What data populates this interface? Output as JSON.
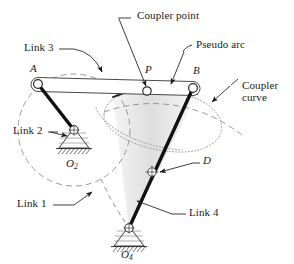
{
  "figure": {
    "width": 294,
    "height": 264,
    "background": "#ffffff"
  },
  "colors": {
    "stroke_dark": "#1a1a1a",
    "stroke_thin": "#555555",
    "dash_gray": "#888888",
    "dot_gray": "#999999",
    "wedge_fill": "#d9d9d9",
    "wedge_fill_light": "#ebebeb",
    "joint_fill": "#ffffff",
    "text": "#1a1a1a"
  },
  "labels": {
    "coupler_point": "Coupler point",
    "pseudo_arc": "Pseudo arc",
    "coupler_curve_line1": "Coupler",
    "coupler_curve_line2": "curve",
    "link3": "Link 3",
    "link2": "Link 2",
    "link1": "Link 1",
    "link4": "Link 4",
    "point_a": "A",
    "point_b": "B",
    "point_p": "P",
    "point_d": "D",
    "pivot_o2_base": "O",
    "pivot_o2_sub": "2",
    "pivot_o4_base": "O",
    "pivot_o4_sub": "4"
  },
  "geometry": {
    "point_a": [
      38,
      84
    ],
    "point_p": [
      147,
      93
    ],
    "point_b": [
      193,
      88
    ],
    "point_o2": [
      74,
      130
    ],
    "point_o4": [
      129,
      228
    ],
    "point_d": [
      152,
      172
    ],
    "crank_circle_center": [
      74,
      130
    ],
    "crank_circle_radius": 56,
    "coupler_bar_from": [
      38,
      84
    ],
    "coupler_bar_to": [
      193,
      88
    ]
  },
  "leaders": {
    "coupler_point_from": [
      118,
      18
    ],
    "coupler_point_to": [
      147,
      90
    ],
    "pseudo_arc_from": [
      184,
      47
    ],
    "pseudo_arc_to": [
      170,
      91
    ],
    "coupler_curve_from": [
      228,
      87
    ],
    "coupler_curve_to": [
      207,
      105
    ],
    "link3_from": [
      70,
      47
    ],
    "link3_to": [
      105,
      80
    ],
    "link2_from": [
      48,
      130
    ],
    "link2_to": [
      68,
      133
    ],
    "link1_from": [
      62,
      205
    ],
    "link1_to": [
      92,
      192
    ],
    "link4_from": [
      185,
      213
    ],
    "link4_to": [
      135,
      200
    ],
    "point_d_from": [
      196,
      161
    ],
    "point_d_to": [
      159,
      172
    ]
  }
}
